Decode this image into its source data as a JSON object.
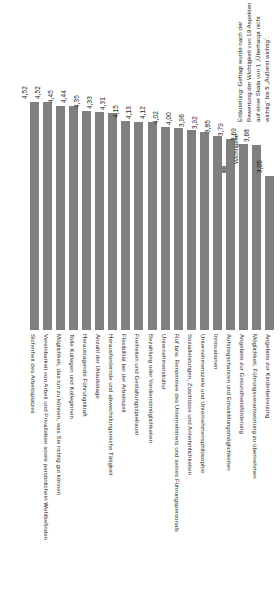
{
  "chart_data": {
    "type": "bar",
    "title": "",
    "xlabel": "",
    "ylabel": "",
    "ylim": [
      0,
      5
    ],
    "grid": false,
    "legend_position": "right",
    "legend": [
      "Wichtigkeit"
    ],
    "categories": [
      "Sicherheit des Arbeitsplatzes",
      "Vereinbarkeit von Arbeit und Privatleben sowie persönlichem Wohlbefinden",
      "Möglichkeit, das tun zu können, was Sie richtig gut können",
      "Tolle Kollegen und Kolleginnen",
      "Herausragende Führungskraft",
      "Anzahl der Urlaubstage",
      "Herausfordernde und abwechslungsreiche Tätigkeit",
      "Flexibilität bei der Arbeitszeit",
      "Freiheiten und Gestaltungsspielraum",
      "Bezahlung oder Verdienstmöglichkeiten",
      "Unternehmenskultur",
      "Ruf bzw. Renommee des Unternehmens und seines Führungspersonals",
      "Sozialleistungen, Zuschüsse und Annehmlichkeiten",
      "Unternehmensziele und Unternehmensphilosophie",
      "Innovationen",
      "Aufstiegschancen und Entwicklungsmöglichkeiten",
      "Angebote zur Gesundheitsförderung",
      "Möglichkeit, Führungsverantwortung zu übernehmen",
      "Angebote zur Kinderbetreuung"
    ],
    "values": [
      4.52,
      4.52,
      4.45,
      4.44,
      4.35,
      4.33,
      4.31,
      4.15,
      4.13,
      4.12,
      4.02,
      4.0,
      3.96,
      3.92,
      3.85,
      3.79,
      3.69,
      3.68,
      3.05
    ],
    "value_labels": [
      "4,52",
      "4,52",
      "4,45",
      "4,44",
      "4,35",
      "4,33",
      "4,31",
      "4,15",
      "4,13",
      "4,12",
      "4,02",
      "4,00",
      "3,96",
      "3,92",
      "3,85",
      "3,79",
      "3,69",
      "3,68",
      "3,05"
    ],
    "series": [
      {
        "name": "Wichtigkeit",
        "color": "#808080",
        "values": [
          4.52,
          4.52,
          4.45,
          4.44,
          4.35,
          4.33,
          4.31,
          4.15,
          4.13,
          4.12,
          4.02,
          4.0,
          3.96,
          3.92,
          3.85,
          3.79,
          3.69,
          3.68,
          3.05
        ]
      }
    ],
    "annotations": [
      "Erläuterung: Gefragt wurde nach der",
      "Bewertung der Wichtigkeit von 19 Aspekten",
      "auf einer Skala von 1 „Überhaupt nicht",
      "wichtig“ bis 5 „Äußerst wichtig“."
    ]
  },
  "legend": {
    "label": "Wichtigkeit",
    "color": "#808080"
  },
  "note": {
    "lines": [
      "Erläuterung: Gefragt wurde nach der",
      "Bewertung der Wichtigkeit von 19 Aspekten",
      "auf einer Skala von 1 „Überhaupt nicht",
      "wichtig“ bis 5 „Äußerst wichtig“."
    ]
  }
}
